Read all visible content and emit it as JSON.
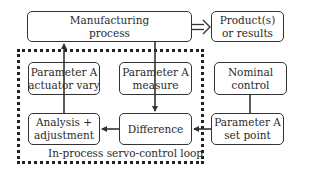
{
  "diagram": {
    "nodes": {
      "manufacturing_process": {
        "line1": "Manufacturing",
        "line2": "process"
      },
      "products": {
        "line1": "Product(s)",
        "line2": "or results"
      },
      "actuator": {
        "line1": "Parameter A",
        "line2": "actuator vary"
      },
      "measure": {
        "line1": "Parameter A",
        "line2": "measure"
      },
      "nominal": {
        "line1": "Nominal",
        "line2": "control"
      },
      "analysis": {
        "line1": "Analysis +",
        "line2": "adjustment"
      },
      "difference": {
        "line1": "Difference",
        "line2": ""
      },
      "set_point": {
        "line1": "Parameter A",
        "line2": "set point"
      }
    },
    "loop_caption": "In-process servo-control loop",
    "edges": [
      {
        "from": "manufacturing_process",
        "to": "products",
        "style": "double-arrow"
      },
      {
        "from": "measure",
        "to": "difference",
        "style": "arrow"
      },
      {
        "from": "nominal",
        "to": "set_point",
        "style": "line"
      },
      {
        "from": "set_point",
        "to": "difference",
        "style": "arrow"
      },
      {
        "from": "difference",
        "to": "analysis",
        "style": "arrow"
      },
      {
        "from": "analysis",
        "to": "actuator",
        "style": "line"
      },
      {
        "from": "actuator",
        "to": "manufacturing_process",
        "style": "arrow"
      },
      {
        "from": "manufacturing_process",
        "to": "measure",
        "style": "line"
      }
    ]
  }
}
